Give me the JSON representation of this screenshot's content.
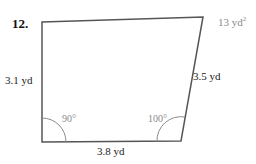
{
  "problem": {
    "number": "12.",
    "area": "13 yd",
    "area_exp": "2",
    "shape": "quadrilateral"
  },
  "sides": {
    "left": "3.1 yd",
    "right": "3.5 yd",
    "bottom": "3.8 yd"
  },
  "angles": {
    "bottom_left": "90°",
    "bottom_right": "100°"
  },
  "colors": {
    "stroke": "#555555",
    "arc": "#8a8a8a",
    "answer": "#8a8a8a"
  }
}
